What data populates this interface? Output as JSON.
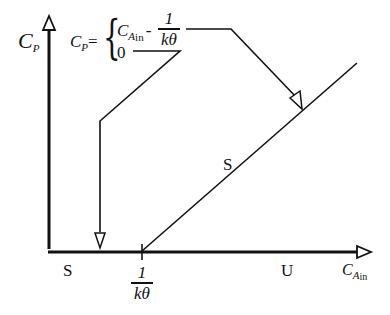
{
  "diagram": {
    "type": "steady-state bifurcation plot",
    "y_axis": {
      "symbol": "C",
      "subscript": "P"
    },
    "x_axis": {
      "symbol": "C",
      "subscript": "A",
      "subsubscript": "in"
    },
    "equation": {
      "lhs_symbol": "C",
      "lhs_subscript": "P",
      "equals": "=",
      "case1_symbol": "C",
      "case1_subscript": "A",
      "case1_subsubscript": "in",
      "case1_minus": "-",
      "case1_frac_num": "1",
      "case1_frac_den": "kθ",
      "case2_value": "0"
    },
    "threshold_label": {
      "numerator": "1",
      "denominator": "kθ"
    },
    "stability_labels": {
      "lower_left": "S",
      "lower_right": "U",
      "diagonal": "S"
    },
    "colors": {
      "ink": "#111111",
      "background": "#ffffff"
    }
  }
}
